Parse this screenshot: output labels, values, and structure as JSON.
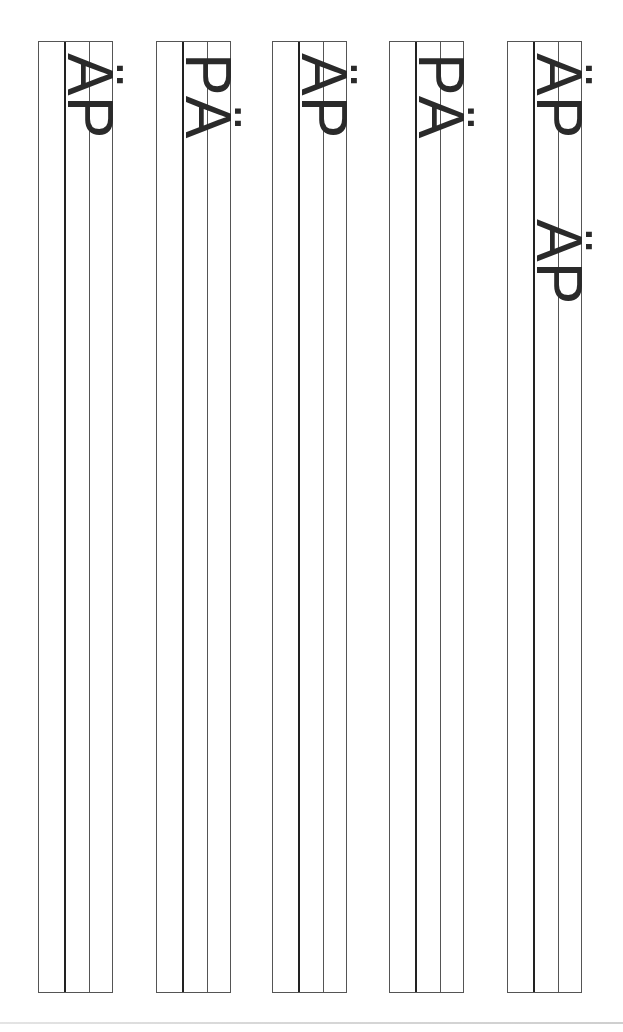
{
  "worksheet": {
    "type": "letter-tracing-practice",
    "orientation": "rotated-90",
    "strips": [
      {
        "index": 1,
        "left": 38,
        "glyphs": [
          {
            "text": "ÄP",
            "top": 52
          }
        ]
      },
      {
        "index": 2,
        "left": 156,
        "glyphs": [
          {
            "text": "PÄ",
            "top": 52
          }
        ]
      },
      {
        "index": 3,
        "left": 272,
        "glyphs": [
          {
            "text": "ÄP",
            "top": 52
          }
        ]
      },
      {
        "index": 4,
        "left": 389,
        "glyphs": [
          {
            "text": "PÄ",
            "top": 52
          }
        ]
      },
      {
        "index": 5,
        "left": 507,
        "glyphs": [
          {
            "text": "ÄP",
            "top": 52
          },
          {
            "text": "ÄP",
            "top": 218
          }
        ]
      }
    ],
    "colors": {
      "ink": "#2a2a2a",
      "border": "#555555",
      "guide_thick": "#222222"
    }
  }
}
